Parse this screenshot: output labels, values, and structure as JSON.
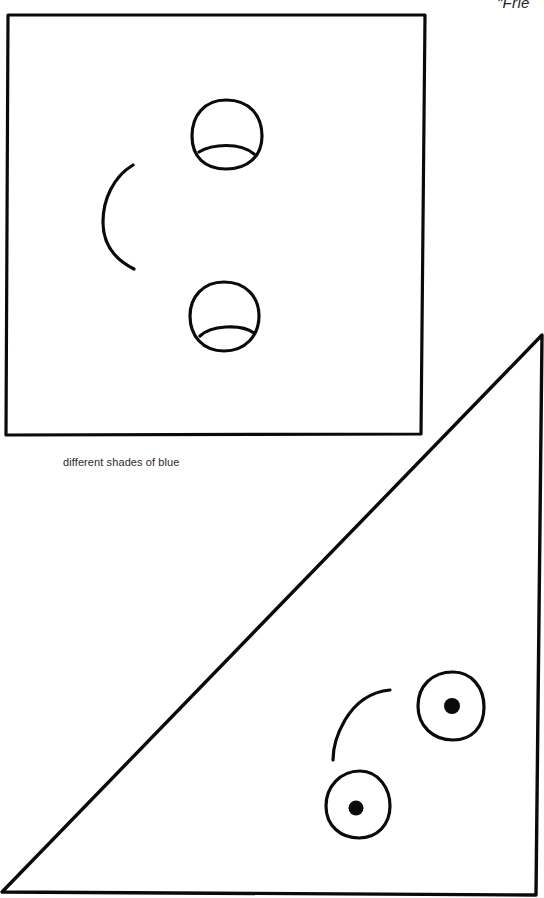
{
  "page": {
    "header_title": "\"Frie",
    "caption": "different shades of blue"
  },
  "figures": [
    {
      "shape": "square",
      "face": {
        "eyes": [
          "half-lid-eye",
          "half-lid-eye"
        ],
        "mouth": "smile-arc",
        "orientation": "rotated-90"
      }
    },
    {
      "shape": "right-triangle",
      "face": {
        "eyes": [
          "pupil-eye",
          "pupil-eye"
        ],
        "mouth": "smile-arc",
        "orientation": "rotated"
      }
    }
  ],
  "colors": {
    "ink": "#0a0a0a",
    "paper": "#ffffff",
    "caption_text": "#2a2a2a"
  }
}
